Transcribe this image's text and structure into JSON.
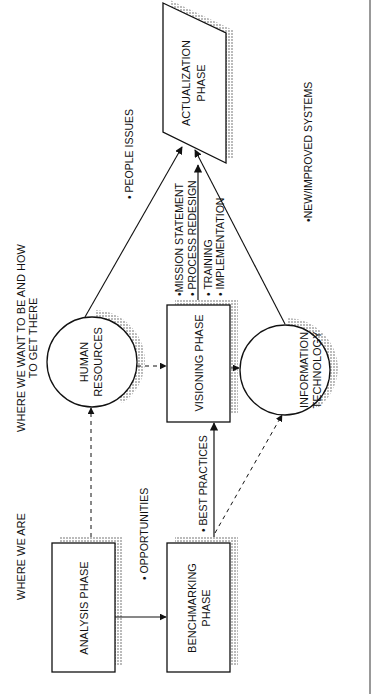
{
  "diagram": {
    "orientation": "rotated-90-ccw",
    "headings": {
      "current": "WHERE WE ARE",
      "future_line1": "WHERE WE WANT TO BE AND HOW",
      "future_line2": "TO GET THERE"
    },
    "nodes": {
      "analysis": {
        "label": "ANALYSIS PHASE",
        "shape": "rectangle"
      },
      "benchmarking": {
        "line1": "BENCHMARKING",
        "line2": "PHASE",
        "shape": "rectangle"
      },
      "visioning": {
        "label": "VISIONING PHASE",
        "shape": "rectangle"
      },
      "human_resources": {
        "line1": "HUMAN",
        "line2": "RESOURCES",
        "shape": "circle"
      },
      "information_technology": {
        "line1": "INFORMATION",
        "line2": "TECHNOLOGY",
        "shape": "circle"
      },
      "actualization": {
        "line1": "ACTUALIZATION",
        "line2": "PHASE",
        "shape": "parallelogram"
      }
    },
    "edge_labels": {
      "opportunities": "• OPPORTUNITIES",
      "best_practices": "• BEST PRACTICES",
      "people_issues": "• PEOPLE ISSUES",
      "mission_statement": "•MISSION STATEMENT",
      "process_redesign": "• PROCESS REDESIGN",
      "training": "• TRAINING",
      "implementation": "• IMPLEMENTATION",
      "new_systems": "•NEW/IMPROVED SYSTEMS"
    },
    "edges": [
      {
        "from": "analysis",
        "to": "benchmarking",
        "style": "solid",
        "label": "opportunities"
      },
      {
        "from": "analysis",
        "to": "human_resources",
        "style": "dashed"
      },
      {
        "from": "benchmarking",
        "to": "visioning",
        "style": "solid",
        "label": "best_practices"
      },
      {
        "from": "benchmarking",
        "to": "information_technology",
        "style": "dashed"
      },
      {
        "from": "human_resources",
        "to": "visioning",
        "style": "dashed"
      },
      {
        "from": "visioning",
        "to": "information_technology",
        "style": "dashed"
      },
      {
        "from": "human_resources",
        "to": "actualization",
        "style": "solid",
        "label": "people_issues"
      },
      {
        "from": "visioning",
        "to": "actualization",
        "style": "solid"
      },
      {
        "from": "information_technology",
        "to": "actualization",
        "style": "solid",
        "label": "new_systems"
      }
    ]
  }
}
